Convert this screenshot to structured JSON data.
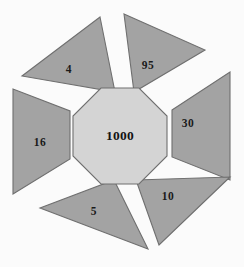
{
  "diagram": {
    "type": "radial-petal-diagram",
    "background_color": "#fbfbfb",
    "petal_fill": "#a3a3a3",
    "petal_stroke": "#6f6f6f",
    "core_fill": "#d4d4d4",
    "core_stroke": "#6f6f6f",
    "label_color": "#1a1a1a",
    "core": {
      "shape": "octagon",
      "label": "1000",
      "center_x": 120,
      "center_y": 136
    },
    "petals": [
      {
        "id": "petal-top-left",
        "label": "4",
        "shape": "triangle",
        "direction": "upper-left",
        "points": "100,17 115,92 22,76",
        "label_x": 69,
        "label_y": 70
      },
      {
        "id": "petal-top-right",
        "label": "95",
        "shape": "triangle",
        "direction": "upper-right",
        "points": "124,14 205,50 134,92",
        "label_x": 148,
        "label_y": 66
      },
      {
        "id": "petal-right",
        "label": "30",
        "shape": "trapezoid",
        "direction": "right",
        "points": "172,110 230,72 230,180 172,157",
        "label_x": 188,
        "label_y": 124
      },
      {
        "id": "petal-bottom-right",
        "label": "10",
        "shape": "triangle",
        "direction": "lower-right",
        "points": "136,180 230,177 159,245",
        "label_x": 168,
        "label_y": 197
      },
      {
        "id": "petal-bottom-left",
        "label": "5",
        "shape": "triangle",
        "direction": "lower-left",
        "points": "114,180 148,249 40,208",
        "label_x": 94,
        "label_y": 212
      },
      {
        "id": "petal-left",
        "label": "16",
        "shape": "trapezoid",
        "direction": "left",
        "points": "70,111 70,159 13,194 13,89",
        "label_x": 40,
        "label_y": 143
      }
    ]
  }
}
